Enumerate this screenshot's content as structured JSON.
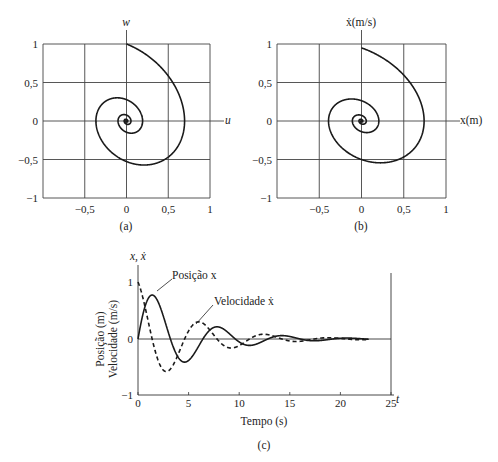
{
  "chart_data": [
    {
      "id": "a",
      "type": "line",
      "caption": "(a)",
      "xlabel": "u",
      "ylabel": "w",
      "xlim": [
        -1,
        1
      ],
      "ylim": [
        -1,
        1
      ],
      "grid": true,
      "xticks": [
        "-0,5",
        "0",
        "0,5",
        "1"
      ],
      "yticks": [
        "1",
        "0,5",
        "0",
        "-0,5",
        "-1"
      ],
      "series": [
        {
          "name": "phase trajectory",
          "style": "solid",
          "description": "clockwise spiral starting at (0, 1) converging to origin",
          "points": [
            [
              0,
              1
            ],
            [
              0.35,
              0.82
            ],
            [
              0.6,
              0.45
            ],
            [
              0.7,
              0.05
            ],
            [
              0.6,
              -0.3
            ],
            [
              0.3,
              -0.5
            ],
            [
              0.05,
              -0.52
            ],
            [
              -0.25,
              -0.35
            ],
            [
              -0.35,
              0
            ],
            [
              -0.2,
              0.25
            ],
            [
              0,
              0.28
            ],
            [
              0.15,
              0.15
            ],
            [
              0.2,
              0
            ],
            [
              0.1,
              -0.15
            ],
            [
              -0.05,
              -0.12
            ],
            [
              -0.1,
              0
            ],
            [
              -0.05,
              0.08
            ],
            [
              0.05,
              0.05
            ],
            [
              0.05,
              -0.02
            ],
            [
              0,
              0
            ]
          ]
        }
      ]
    },
    {
      "id": "b",
      "type": "line",
      "caption": "(b)",
      "xlabel": "x(m)",
      "ylabel": "ẋ(m/s)",
      "xlim": [
        -1,
        1
      ],
      "ylim": [
        -1,
        1
      ],
      "grid": true,
      "xticks": [
        "-0,5",
        "0",
        "0,5",
        "1"
      ],
      "yticks": [
        "1",
        "0,5",
        "0",
        "-0,5",
        "-1"
      ],
      "series": [
        {
          "name": "phase trajectory",
          "style": "solid",
          "description": "clockwise spiral starting at (0, 0.95) converging to origin",
          "points": [
            [
              0,
              0.95
            ],
            [
              0.5,
              0.6
            ],
            [
              0.74,
              0.05
            ],
            [
              0.55,
              -0.45
            ],
            [
              0.25,
              -0.56
            ],
            [
              -0.1,
              -0.45
            ],
            [
              -0.38,
              -0.05
            ],
            [
              -0.3,
              0.2
            ],
            [
              -0.05,
              0.29
            ],
            [
              0.15,
              0.15
            ],
            [
              0.2,
              0
            ],
            [
              0.1,
              -0.14
            ],
            [
              -0.05,
              -0.12
            ],
            [
              -0.1,
              0
            ],
            [
              -0.05,
              0.08
            ],
            [
              0.05,
              0.05
            ],
            [
              0.04,
              -0.03
            ],
            [
              0,
              0
            ]
          ]
        }
      ]
    },
    {
      "id": "c",
      "type": "line",
      "caption": "(c)",
      "xlabel": "Tempo (s)",
      "xaxis_end_label": "t",
      "ylabel_lines": [
        "Posição (m)",
        "Velocidade (m/s)"
      ],
      "ytop_label": "x, ẋ",
      "xlim": [
        0,
        25
      ],
      "ylim": [
        -1,
        1
      ],
      "grid": false,
      "xticks": [
        "0",
        "5",
        "10",
        "15",
        "20",
        "25"
      ],
      "yticks": [
        "1",
        "0",
        "-1"
      ],
      "annotations": [
        {
          "text": "Posição x",
          "x": 3.3,
          "y": 1.05
        },
        {
          "text": "Velocidade ẋ",
          "x": 7.8,
          "y": 0.6
        }
      ],
      "series": [
        {
          "name": "Posição x",
          "style": "solid",
          "model": {
            "amp": 1.02,
            "decay": 0.2,
            "omega": 0.98,
            "phase": "sin"
          },
          "x": [
            0,
            1.3,
            3.2,
            4.6,
            6.4,
            7.9,
            9.6,
            11.1,
            12.8,
            14.3,
            16.0,
            17.5,
            19.2,
            22.8
          ],
          "values": [
            0,
            0.77,
            0,
            -0.44,
            0,
            0.21,
            0,
            -0.12,
            0,
            0.07,
            0,
            -0.04,
            0,
            0
          ]
        },
        {
          "name": "Velocidade ẋ",
          "style": "dashed",
          "model": {
            "amp": 1.0,
            "decay": 0.2,
            "omega": 0.98,
            "phase": "dcos"
          },
          "x": [
            0,
            1.5,
            2.8,
            4.4,
            6.0,
            7.6,
            9.2,
            10.8,
            12.4,
            14.0,
            15.6,
            17.2,
            22.8
          ],
          "values": [
            1.0,
            0,
            -0.6,
            0,
            0.31,
            0,
            -0.17,
            0,
            0.09,
            0,
            -0.05,
            0,
            0
          ]
        }
      ]
    }
  ]
}
